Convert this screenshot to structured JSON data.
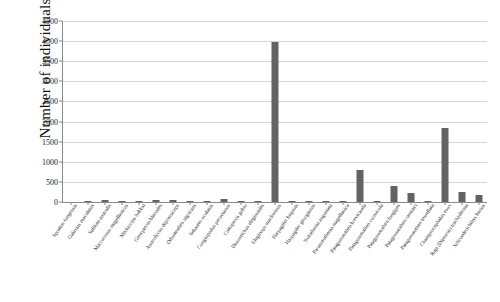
{
  "chart_data": {
    "type": "bar",
    "title": "",
    "subtitle": "",
    "xlabel": "",
    "ylabel": "Number of individuals",
    "ylim": [
      0,
      4500
    ],
    "ytick_step": 500,
    "yticks": [
      0,
      500,
      1000,
      1500,
      2000,
      2500,
      3000,
      3500,
      4000,
      4500
    ],
    "grid": true,
    "legend": "none",
    "bar_color": "#636363",
    "categories": [
      "Sprattus fuegensis",
      "Galaxias maculatus",
      "Salilota australis",
      "Macruronus magellanicus",
      "Merluccius hubbsi",
      "Genypterus blacodes",
      "Austrolycus depressiceps",
      "Odontesthes nigricans",
      "Sebastes oculatus",
      "Congiopodus peruvianus",
      "Cottoperca gobio",
      "Dissostichus eleginoides",
      "Eleginops maclovinus",
      "Harpagifer bispinis",
      "Harpagifer georgianus",
      "Notothenia angustata",
      "Paranotothenia magellanica",
      "Patagonotothen brevicauda",
      "Patagonotothen cornucola",
      "Patagonotothen longipes",
      "Patagonotothen ramsayi",
      "Patagonotothen tessellata",
      "Champsocephalus esox",
      "Raja (Dipturus) trachyderma",
      "Schroederichthys bivius"
    ],
    "values": [
      0,
      10,
      60,
      8,
      5,
      45,
      40,
      6,
      4,
      65,
      6,
      8,
      3970,
      35,
      5,
      4,
      12,
      800,
      18,
      390,
      235,
      10,
      1830,
      260,
      180
    ]
  }
}
